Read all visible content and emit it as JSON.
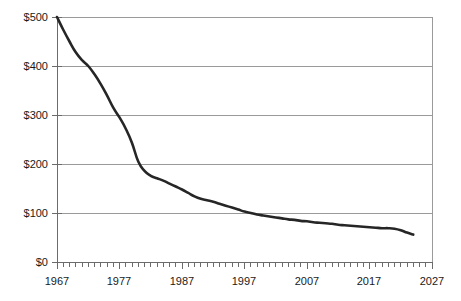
{
  "chart_data": {
    "type": "line",
    "title": "",
    "xlabel": "",
    "ylabel": "",
    "xlim": [
      1967,
      2027
    ],
    "ylim": [
      0,
      500
    ],
    "grid": true,
    "legend": "none",
    "y_tick_labels": [
      "$0",
      "$100",
      "$200",
      "$300",
      "$400",
      "$500"
    ],
    "y_tick_values": [
      0,
      100,
      200,
      300,
      400,
      500
    ],
    "x_tick_labels": [
      "1967",
      "1977",
      "1987",
      "1997",
      "2007",
      "2017",
      "2027"
    ],
    "x_tick_values": [
      1967,
      1977,
      1987,
      1997,
      2007,
      2017,
      2027
    ],
    "x_minor_tick_interval": 1,
    "series": [
      {
        "name": "value",
        "color": "#262626",
        "x": [
          1967,
          1968,
          1969,
          1970,
          1971,
          1972,
          1973,
          1974,
          1975,
          1976,
          1977,
          1978,
          1979,
          1980,
          1981,
          1982,
          1983,
          1984,
          1985,
          1986,
          1987,
          1988,
          1989,
          1990,
          1991,
          1992,
          1993,
          1994,
          1995,
          1996,
          1997,
          1998,
          1999,
          2000,
          2001,
          2002,
          2003,
          2004,
          2005,
          2006,
          2007,
          2008,
          2009,
          2010,
          2011,
          2012,
          2013,
          2014,
          2015,
          2016,
          2017,
          2018,
          2019,
          2020,
          2021,
          2022,
          2023,
          2024
        ],
        "values": [
          500,
          474,
          450,
          428,
          412,
          400,
          383,
          363,
          340,
          315,
          295,
          272,
          243,
          205,
          186,
          176,
          171,
          166,
          160,
          154,
          148,
          141,
          134,
          129,
          126,
          123,
          119,
          115,
          111,
          107,
          103,
          100,
          97,
          95,
          93,
          91,
          89,
          87,
          86,
          84,
          83,
          81,
          80,
          79,
          78,
          76,
          75,
          74,
          73,
          72,
          71,
          70,
          69,
          69,
          68,
          65,
          60,
          56
        ]
      }
    ]
  },
  "axes": {
    "y_axis_name": "dollar-axis",
    "x_axis_name": "year-axis"
  }
}
